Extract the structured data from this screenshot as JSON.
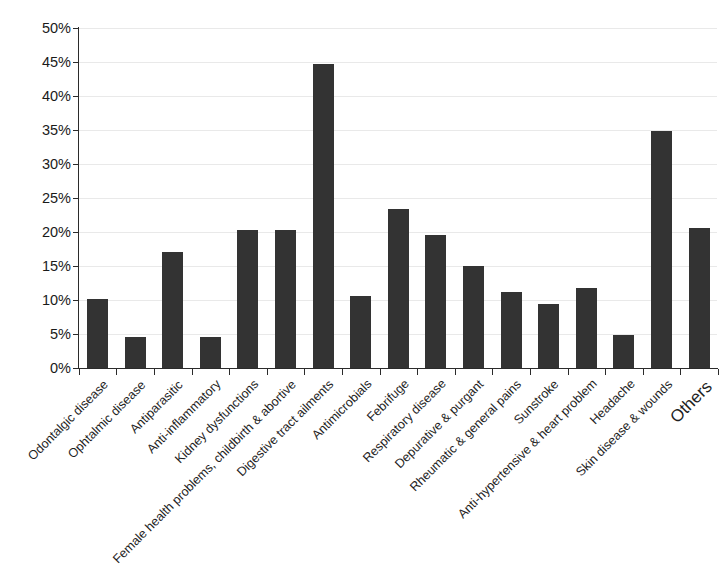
{
  "chart_data": {
    "type": "bar",
    "title": "",
    "subtitle": "",
    "xlabel": "",
    "ylabel": "",
    "ylim": [
      0,
      50
    ],
    "ytick_step": 5,
    "ytick_labels": [
      "0%",
      "5%",
      "10%",
      "15%",
      "20%",
      "25%",
      "30%",
      "35%",
      "40%",
      "45%",
      "50%"
    ],
    "grid": true,
    "legend": null,
    "value_suffix": "%",
    "bar_color": "#333333",
    "gridline_color": "#e9e9e9",
    "axis_color": "#2b2b2b",
    "categories": [
      "Odontalgic disease",
      "Ophtalmic disease",
      "Antiparasitic",
      "Anti-inflammatory",
      "Kidney dysfunctions",
      "Female health problems, childbirth & abortive",
      "Digestive tract ailments",
      "Antimicrobials",
      "Febrifuge",
      "Respiratory disease",
      "Depurative & purgant",
      "Rheumatic & general pains",
      "Sunstroke",
      "Anti-hypertensive & heart problem",
      "Headache",
      "Skin disease & wounds",
      "Others"
    ],
    "values": [
      10.2,
      4.5,
      17.1,
      4.5,
      20.3,
      20.3,
      44.7,
      10.6,
      23.4,
      19.6,
      15.0,
      11.2,
      9.4,
      11.8,
      4.8,
      34.8,
      20.6
    ],
    "emphasis_index": 16
  }
}
